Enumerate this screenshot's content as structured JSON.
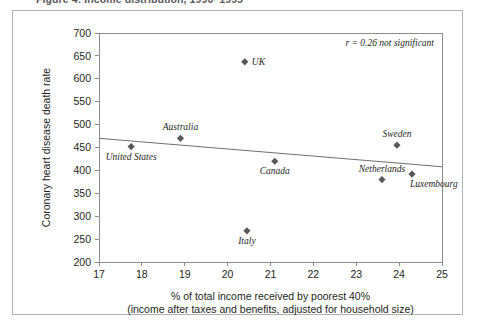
{
  "figure": {
    "caption_clipped": "Figure 4: Income distribution, 1990–1995"
  },
  "chart_data": {
    "type": "scatter",
    "title": "",
    "xlabel": "% of total income received by poorest 40%",
    "xlabel_sub": "(income after taxes and benefits, adjusted for household size)",
    "ylabel": "Coronary heart disease death rate",
    "xlim": [
      17,
      25
    ],
    "ylim": [
      200,
      700
    ],
    "xticks": [
      17,
      18,
      19,
      20,
      21,
      22,
      23,
      24,
      25
    ],
    "yticks": [
      200,
      250,
      300,
      350,
      400,
      450,
      500,
      550,
      600,
      650,
      700
    ],
    "grid": false,
    "legend": "none",
    "annotation": "r = 0.26 not significant",
    "marker_color": "#58585b",
    "trend_color": "#6f6f6f",
    "axis_color": "#8c8c8c",
    "trendline": {
      "x0": 17,
      "y0": 470,
      "x1": 25,
      "y1": 408
    },
    "points": [
      {
        "name": "UK",
        "x": 20.4,
        "y": 637,
        "label_pos": "right"
      },
      {
        "name": "Australia",
        "x": 18.9,
        "y": 470,
        "label_pos": "above"
      },
      {
        "name": "United States",
        "x": 17.75,
        "y": 452,
        "label_pos": "below"
      },
      {
        "name": "Canada",
        "x": 21.1,
        "y": 420,
        "label_pos": "below"
      },
      {
        "name": "Sweden",
        "x": 23.95,
        "y": 455,
        "label_pos": "above"
      },
      {
        "name": "Netherlands",
        "x": 23.6,
        "y": 380,
        "label_pos": "above"
      },
      {
        "name": "Luxembourg",
        "x": 24.3,
        "y": 392,
        "label_pos": "below-right"
      },
      {
        "name": "Italy",
        "x": 20.45,
        "y": 268,
        "label_pos": "below"
      }
    ]
  }
}
